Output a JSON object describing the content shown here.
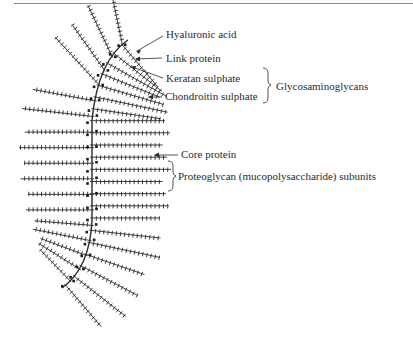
{
  "figure": {
    "labels": {
      "hyaluronic_acid": "Hyaluronic acid",
      "link_protein": "Link protein",
      "keratan_sulphate": "Keratan sulphate",
      "chondroitin_sulphate": "Chondroitin sulphate",
      "glycosaminoglycans": "Glycosaminoglycans",
      "core_protein": "Core protein",
      "proteoglycan_subunits": "Proteoglycan (mucopolysaccharide) subunits"
    },
    "colors": {
      "ink": "#2a2a2a",
      "background": "#ffffff",
      "rule": "#888888"
    },
    "structure": {
      "backbone": "hyaluronic-acid-arc",
      "subunit_count_left": 22,
      "subunit_count_right": 17
    }
  }
}
